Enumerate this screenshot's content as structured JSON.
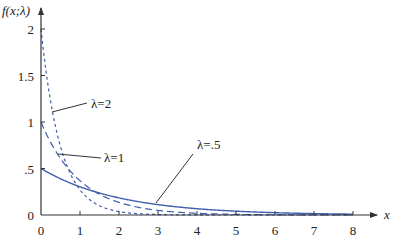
{
  "chart_data": {
    "type": "line",
    "title": "",
    "xlabel": "x",
    "ylabel": "f(x;λ)",
    "xlim": [
      0,
      8
    ],
    "ylim": [
      0,
      2
    ],
    "xticks": [
      "0",
      "1",
      "2",
      "3",
      "4",
      "5",
      "6",
      "7",
      "8"
    ],
    "yticks": [
      "0",
      ".5",
      "1",
      "1.5",
      "2"
    ],
    "grid": false,
    "legend": "inline annotations with leader lines",
    "function": "f(x;λ) = λ·e^(−λx)",
    "series": [
      {
        "name": "λ=2",
        "lambda": 2,
        "style": "short-dash",
        "x": [
          0,
          0.25,
          0.5,
          0.75,
          1,
          1.5,
          2,
          3,
          4,
          5,
          6,
          7,
          8
        ],
        "values": [
          2,
          1.213,
          0.736,
          0.446,
          0.271,
          0.1,
          0.037,
          0.005,
          0.001,
          0,
          0,
          0,
          0
        ]
      },
      {
        "name": "λ=1",
        "lambda": 1,
        "style": "long-dash",
        "x": [
          0,
          0.25,
          0.5,
          0.75,
          1,
          1.5,
          2,
          3,
          4,
          5,
          6,
          7,
          8
        ],
        "values": [
          1,
          0.779,
          0.607,
          0.472,
          0.368,
          0.223,
          0.135,
          0.05,
          0.018,
          0.007,
          0.002,
          0.001,
          0
        ]
      },
      {
        "name": "λ=.5",
        "lambda": 0.5,
        "style": "solid",
        "x": [
          0,
          0.25,
          0.5,
          0.75,
          1,
          1.5,
          2,
          3,
          4,
          5,
          6,
          7,
          8
        ],
        "values": [
          0.5,
          0.441,
          0.389,
          0.344,
          0.303,
          0.236,
          0.184,
          0.112,
          0.068,
          0.041,
          0.025,
          0.015,
          0.009
        ]
      }
    ],
    "annotations": [
      {
        "text": "λ=2",
        "points_to_series": "λ=2"
      },
      {
        "text": "λ=1",
        "points_to_series": "λ=1"
      },
      {
        "text": "λ=.5",
        "points_to_series": "λ=.5"
      }
    ],
    "colors": {
      "curves": "#3f5fae",
      "axes": "#333333",
      "leaders": "#333333"
    }
  }
}
